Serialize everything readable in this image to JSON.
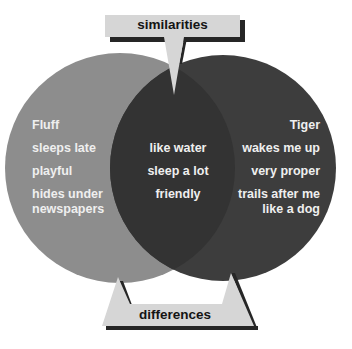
{
  "diagram": {
    "type": "venn",
    "colors": {
      "left_circle": "#8d8d8d",
      "right_circle": "#3d3d3d",
      "intersection": "#333333",
      "callout_fill": "#d6d6d6",
      "callout_shadow": "#262626",
      "circle_text": "#efefef",
      "callout_text": "#141414"
    },
    "callouts": {
      "top": "similarities",
      "bottom": "differences"
    },
    "left_set": {
      "title": "Fluff",
      "items": [
        "sleeps late",
        "playful",
        "hides under",
        "newspapers"
      ]
    },
    "intersection": {
      "items": [
        "like water",
        "sleep a lot",
        "friendly"
      ]
    },
    "right_set": {
      "title": "Tiger",
      "items": [
        "wakes me up",
        "very proper",
        "trails after me",
        "like a dog"
      ]
    }
  }
}
